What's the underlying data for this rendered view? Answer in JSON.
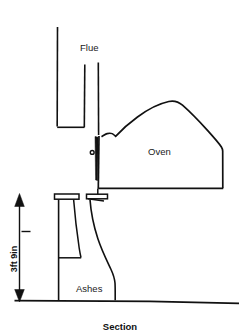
{
  "figure": {
    "caption": "Section",
    "labels": {
      "flue": "Flue",
      "oven": "Oven",
      "ashes": "Ashes"
    },
    "dimension": {
      "value": "3ft 9in",
      "orientation": "vertical",
      "measures": "height from ground line to oven floor level"
    },
    "colors": {
      "ink": "#111111",
      "background": "#ffffff"
    },
    "icons": {
      "arrow_up": "arrow-up-icon",
      "arrow_down": "arrow-down-icon",
      "pivot": "pivot-dot-icon"
    },
    "drawing_type": "architectural-section"
  }
}
